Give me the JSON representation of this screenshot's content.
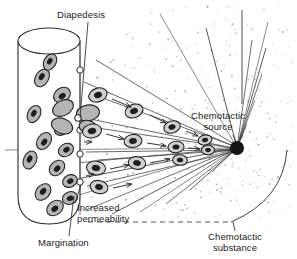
{
  "figure": {
    "width": 297,
    "height": 259,
    "background": "#ffffff"
  },
  "labels": {
    "diapedesis": "Diapedesis",
    "chemotactic_source_line1": "Chemotactic",
    "chemotactic_source_line2": "source",
    "increased_permeability_line1": "Increased",
    "increased_permeability_line2": "permeability",
    "margination": "Margination",
    "chemotactic_substance_line1": "Chemotactic",
    "chemotactic_substance_line2": "substance"
  },
  "colors": {
    "line": "#2b2b2b",
    "text": "#1a1a1a",
    "cell_fill": "#b5b5b5",
    "cell_fill_light": "#cfcfcf",
    "nucleus": "#1e1e1e",
    "source_dot": "#141414",
    "stipple": "#9a9a9a",
    "vessel_fill": "#ffffff"
  },
  "structures": {
    "blood_vessel": {
      "name": "blood-vessel-cylinder",
      "x": 18,
      "y": 28,
      "width": 62,
      "height": 196,
      "ellipse_rx": 31,
      "ellipse_ry": 13
    },
    "chemotactic_source": {
      "name": "chemotactic-source-dot",
      "cx": 237,
      "cy": 148,
      "r": 7,
      "ray_count": 19
    },
    "endothelial_gaps": {
      "name": "endothelial-gap-circles",
      "count": 5,
      "cx": 80,
      "cy_values": [
        70,
        112,
        130,
        154,
        182
      ],
      "r": 3.2
    },
    "migration_channels": {
      "name": "chemotaxis-migration-channels",
      "count": 5
    },
    "vessel_cells": {
      "name": "marginating-leukocytes",
      "count": 13
    },
    "tissue_cells": {
      "name": "migrating-leukocytes",
      "count": 12
    },
    "stipple_field": {
      "name": "chemotactic-gradient-stipple",
      "dot_count": 340
    }
  },
  "leaders": {
    "diapedesis_leader": {
      "x1": 88,
      "y1": 22,
      "x2": 80,
      "y2": 118
    },
    "increased_permeability_leader": {
      "x1": 72,
      "y1": 205,
      "x2": 81,
      "y2": 186
    },
    "margination_leader": {
      "x1": 69,
      "y1": 236,
      "x2": 73,
      "y2": 196
    },
    "chemotactic_source_leader": {
      "x1": 232,
      "y1": 134,
      "x2": 236,
      "y2": 142
    },
    "chemotactic_substance_leader": {
      "x1": 235,
      "y1": 231,
      "x2": 235,
      "y2": 222
    }
  }
}
